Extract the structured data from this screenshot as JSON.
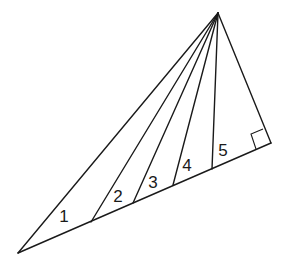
{
  "diagram": {
    "type": "geometry-figure",
    "colors": {
      "stroke": "#1a1a1a",
      "background": "#ffffff"
    },
    "vertices": {
      "apex": [
        218,
        13
      ],
      "left": [
        18,
        253
      ],
      "right": [
        271,
        143
      ]
    },
    "base_points": [
      [
        91,
        222
      ],
      [
        133,
        203
      ],
      [
        173,
        185
      ],
      [
        212,
        169
      ]
    ],
    "right_angle_marker": [
      [
        251,
        134
      ],
      [
        256,
        149
      ],
      [
        271,
        143
      ],
      [
        263,
        129
      ]
    ],
    "labels": [
      {
        "text": "1",
        "x": 64,
        "y": 218
      },
      {
        "text": "2",
        "x": 118,
        "y": 198
      },
      {
        "text": "3",
        "x": 153,
        "y": 184
      },
      {
        "text": "4",
        "x": 187,
        "y": 167
      },
      {
        "text": "5",
        "x": 223,
        "y": 152
      }
    ]
  }
}
